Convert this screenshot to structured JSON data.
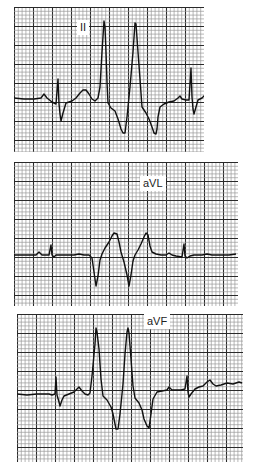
{
  "figure": {
    "type": "ecg_rhythm_strips",
    "grid": {
      "minor_px": 3.8,
      "major_every": 5,
      "minor_color": "#9a9a9a",
      "major_color": "#2a2a2a",
      "paper_color": "#ffffff",
      "trace_color": "#111111"
    },
    "strips": [
      {
        "lead": "II",
        "box": {
          "x": 14,
          "y": 7,
          "w": 190,
          "h": 145
        },
        "label_pos": {
          "x": 63,
          "y": 13
        },
        "trace": [
          [
            0,
            91
          ],
          [
            10,
            92
          ],
          [
            20,
            92
          ],
          [
            27,
            91
          ],
          [
            30,
            87
          ],
          [
            33,
            91
          ],
          [
            38,
            95
          ],
          [
            42,
            97
          ],
          [
            44,
            72
          ],
          [
            45,
            97
          ],
          [
            46,
            107
          ],
          [
            47,
            114
          ],
          [
            49,
            106
          ],
          [
            52,
            96
          ],
          [
            58,
            94
          ],
          [
            62,
            91
          ],
          [
            66,
            86
          ],
          [
            69,
            83
          ],
          [
            72,
            83
          ],
          [
            75,
            87
          ],
          [
            78,
            92
          ],
          [
            81,
            94
          ],
          [
            84,
            91
          ],
          [
            86,
            80
          ],
          [
            88,
            45
          ],
          [
            90,
            14
          ],
          [
            91,
            20
          ],
          [
            92,
            45
          ],
          [
            93,
            75
          ],
          [
            94,
            96
          ],
          [
            97,
            101
          ],
          [
            101,
            104
          ],
          [
            104,
            112
          ],
          [
            107,
            122
          ],
          [
            109,
            126
          ],
          [
            111,
            126
          ],
          [
            113,
            110
          ],
          [
            116,
            80
          ],
          [
            119,
            45
          ],
          [
            121,
            16
          ],
          [
            122,
            17
          ],
          [
            124,
            45
          ],
          [
            126,
            72
          ],
          [
            128,
            100
          ],
          [
            132,
            106
          ],
          [
            135,
            112
          ],
          [
            138,
            120
          ],
          [
            140,
            126
          ],
          [
            142,
            127
          ],
          [
            143,
            122
          ],
          [
            144,
            110
          ],
          [
            146,
            100
          ],
          [
            150,
            97
          ],
          [
            155,
            95
          ],
          [
            160,
            94
          ],
          [
            164,
            91
          ],
          [
            166,
            89
          ],
          [
            168,
            92
          ],
          [
            172,
            93
          ],
          [
            175,
            93
          ],
          [
            177,
            61
          ],
          [
            178,
            90
          ],
          [
            179,
            102
          ],
          [
            180,
            107
          ],
          [
            182,
            100
          ],
          [
            184,
            93
          ],
          [
            188,
            91
          ],
          [
            191,
            88
          ],
          [
            194,
            85
          ],
          [
            196,
            83
          ],
          [
            197,
            87
          ]
        ]
      },
      {
        "lead": "aVL",
        "box": {
          "x": 14,
          "y": 162,
          "w": 224,
          "h": 144
        },
        "label_pos": {
          "x": 126,
          "y": 14
        },
        "trace": [
          [
            0,
            93
          ],
          [
            15,
            93
          ],
          [
            22,
            93
          ],
          [
            25,
            90
          ],
          [
            28,
            93
          ],
          [
            33,
            93
          ],
          [
            35,
            93
          ],
          [
            37,
            83
          ],
          [
            38,
            93
          ],
          [
            40,
            95
          ],
          [
            42,
            93
          ],
          [
            50,
            93
          ],
          [
            60,
            93
          ],
          [
            65,
            92
          ],
          [
            70,
            93
          ],
          [
            75,
            93
          ],
          [
            78,
            96
          ],
          [
            80,
            110
          ],
          [
            82,
            124
          ],
          [
            84,
            114
          ],
          [
            86,
            98
          ],
          [
            88,
            92
          ],
          [
            91,
            86
          ],
          [
            95,
            80
          ],
          [
            98,
            74
          ],
          [
            100,
            71
          ],
          [
            103,
            72
          ],
          [
            105,
            80
          ],
          [
            107,
            90
          ],
          [
            110,
            100
          ],
          [
            113,
            113
          ],
          [
            115,
            124
          ],
          [
            117,
            113
          ],
          [
            119,
            99
          ],
          [
            121,
            93
          ],
          [
            124,
            88
          ],
          [
            127,
            82
          ],
          [
            130,
            75
          ],
          [
            132,
            71
          ],
          [
            134,
            73
          ],
          [
            136,
            84
          ],
          [
            138,
            90
          ],
          [
            142,
            92
          ],
          [
            147,
            93
          ],
          [
            152,
            93
          ],
          [
            155,
            91
          ],
          [
            158,
            93
          ],
          [
            162,
            94
          ],
          [
            168,
            95
          ],
          [
            170,
            82
          ],
          [
            171,
            94
          ],
          [
            173,
            96
          ],
          [
            176,
            94
          ],
          [
            180,
            93
          ],
          [
            188,
            93
          ],
          [
            193,
            92
          ],
          [
            198,
            93
          ],
          [
            205,
            93
          ],
          [
            215,
            93
          ],
          [
            222,
            92
          ]
        ]
      },
      {
        "lead": "aVF",
        "box": {
          "x": 17,
          "y": 314,
          "w": 226,
          "h": 148
        },
        "label_pos": {
          "x": 127,
          "y": 0
        },
        "trace": [
          [
            0,
            80
          ],
          [
            10,
            81
          ],
          [
            20,
            80
          ],
          [
            28,
            80
          ],
          [
            32,
            80
          ],
          [
            35,
            81
          ],
          [
            38,
            80
          ],
          [
            39,
            63
          ],
          [
            40,
            81
          ],
          [
            42,
            88
          ],
          [
            43,
            92
          ],
          [
            45,
            86
          ],
          [
            47,
            82
          ],
          [
            52,
            80
          ],
          [
            57,
            78
          ],
          [
            60,
            75
          ],
          [
            62,
            73
          ],
          [
            65,
            77
          ],
          [
            68,
            80
          ],
          [
            71,
            81
          ],
          [
            73,
            79
          ],
          [
            75,
            62
          ],
          [
            78,
            30
          ],
          [
            79,
            14
          ],
          [
            80,
            18
          ],
          [
            82,
            35
          ],
          [
            84,
            65
          ],
          [
            86,
            82
          ],
          [
            90,
            86
          ],
          [
            94,
            93
          ],
          [
            96,
            100
          ],
          [
            98,
            110
          ],
          [
            99,
            115
          ],
          [
            101,
            115
          ],
          [
            103,
            100
          ],
          [
            106,
            70
          ],
          [
            108,
            40
          ],
          [
            110,
            18
          ],
          [
            111,
            14
          ],
          [
            112,
            19
          ],
          [
            114,
            45
          ],
          [
            116,
            72
          ],
          [
            118,
            84
          ],
          [
            122,
            89
          ],
          [
            125,
            96
          ],
          [
            127,
            105
          ],
          [
            130,
            112
          ],
          [
            132,
            114
          ],
          [
            134,
            100
          ],
          [
            136,
            85
          ],
          [
            140,
            78
          ],
          [
            145,
            77
          ],
          [
            150,
            76
          ],
          [
            152,
            73
          ],
          [
            155,
            76
          ],
          [
            160,
            76
          ],
          [
            164,
            76
          ],
          [
            168,
            75
          ],
          [
            170,
            62
          ],
          [
            171,
            78
          ],
          [
            172,
            83
          ],
          [
            174,
            80
          ],
          [
            178,
            75
          ],
          [
            182,
            73
          ],
          [
            186,
            72
          ],
          [
            190,
            68
          ],
          [
            193,
            66
          ],
          [
            196,
            70
          ],
          [
            199,
            72
          ],
          [
            204,
            71
          ],
          [
            210,
            69
          ],
          [
            216,
            70
          ],
          [
            222,
            68
          ],
          [
            225,
            69
          ]
        ]
      }
    ]
  }
}
